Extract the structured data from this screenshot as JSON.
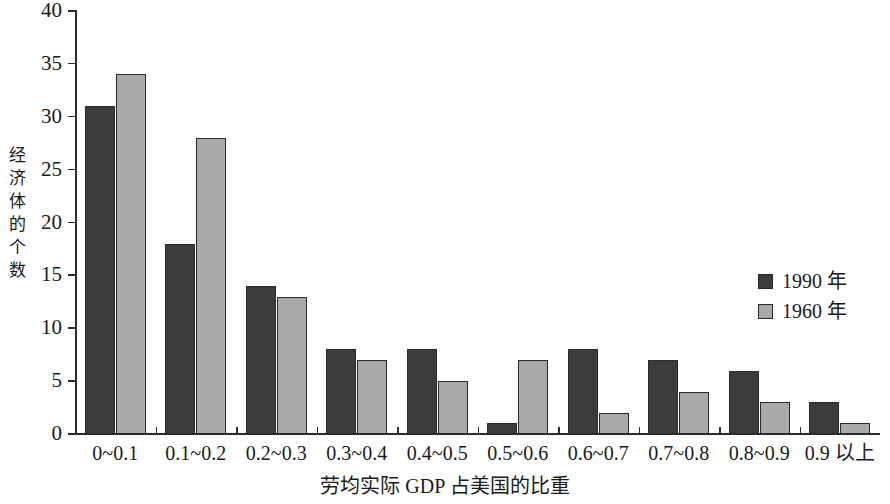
{
  "chart_data": {
    "type": "bar",
    "title": "",
    "subtitle": "",
    "xlabel": "劳均实际 GDP 占美国的比重",
    "ylabel": "经济体的个数",
    "categories": [
      "0~0.1",
      "0.1~0.2",
      "0.2~0.3",
      "0.3~0.4",
      "0.4~0.5",
      "0.5~0.6",
      "0.6~0.7",
      "0.7~0.8",
      "0.8~0.9",
      "0.9 以上"
    ],
    "series": [
      {
        "name": "1990 年",
        "color": "#3c3c3c",
        "values": [
          31,
          18,
          14,
          8,
          8,
          1,
          8,
          7,
          6,
          3
        ]
      },
      {
        "name": "1960 年",
        "color": "#a9a9a9",
        "values": [
          34,
          28,
          13,
          7,
          5,
          7,
          2,
          4,
          3,
          1
        ]
      }
    ],
    "ylim": [
      0,
      40
    ],
    "y_ticks": [
      0,
      5,
      10,
      15,
      20,
      25,
      30,
      35,
      40
    ],
    "y_tick_labels": [
      "0",
      "5",
      "10",
      "15",
      "20",
      "25",
      "30",
      "35",
      "40"
    ],
    "grid": false,
    "legend_position": "inside-right",
    "axis_color": "#2b2b2b",
    "background": "#ffffff"
  }
}
